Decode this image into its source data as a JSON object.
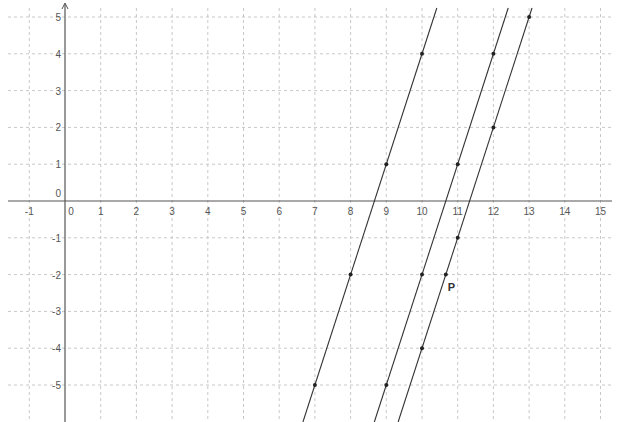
{
  "chart_data": {
    "type": "line",
    "title": "",
    "xlabel": "",
    "ylabel": "",
    "xlim": [
      -1.5,
      15.3
    ],
    "ylim": [
      -5.8,
      5.2
    ],
    "grid": true,
    "x_ticks": [
      -1,
      0,
      1,
      2,
      3,
      4,
      5,
      6,
      7,
      8,
      9,
      10,
      11,
      12,
      13,
      14,
      15
    ],
    "y_ticks": [
      -5,
      -4,
      -3,
      -2,
      -1,
      0,
      1,
      2,
      3,
      4,
      5
    ],
    "series": [
      {
        "name": "line-1",
        "equation": "y = 3x - 26",
        "slope": 3,
        "intercept": -26,
        "points": [
          [
            7,
            -5
          ],
          [
            8,
            -2
          ],
          [
            9,
            1
          ],
          [
            10,
            4
          ]
        ]
      },
      {
        "name": "line-2",
        "equation": "y = 3x - 32",
        "slope": 3,
        "intercept": -32,
        "points": [
          [
            9,
            -5
          ],
          [
            10,
            -2
          ],
          [
            11,
            1
          ],
          [
            12,
            4
          ]
        ]
      },
      {
        "name": "line-3",
        "equation": "y = 3x - 34",
        "slope": 3,
        "intercept": -34,
        "points": [
          [
            10,
            -4
          ],
          [
            11,
            -1
          ],
          [
            12,
            2
          ],
          [
            13,
            5
          ]
        ]
      }
    ],
    "annotations": [
      {
        "label": "P",
        "x": 10.667,
        "y": -2,
        "on": "line-3"
      }
    ]
  },
  "colors": {
    "axis": "#555555",
    "grid": "#c8c8c8",
    "line": "#333333",
    "point": "#222222"
  }
}
